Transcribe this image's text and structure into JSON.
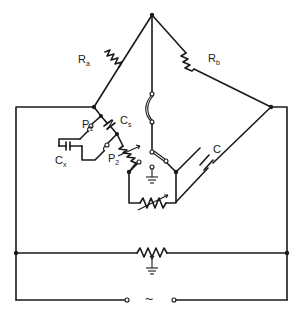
{
  "diagram": {
    "type": "circuit-schematic",
    "labels": {
      "ra": {
        "main": "R",
        "sub": "a"
      },
      "rb": {
        "main": "R",
        "sub": "b"
      },
      "cs": {
        "main": "C",
        "sub": "s"
      },
      "cx": {
        "main": "C",
        "sub": "x"
      },
      "p1": {
        "main": "P",
        "sub": "1"
      },
      "p2": {
        "main": "P",
        "sub": "2"
      },
      "c": {
        "main": "C",
        "sub": ""
      },
      "source": "~"
    },
    "components": [
      "resistor Ra (top-left arm)",
      "resistor Rb (top-right arm)",
      "variable capacitor Cs",
      "capacitor Cx (unknown)",
      "terminal pair P1",
      "terminal pair P2",
      "variable resistor (lower-left arm)",
      "capacitor C (lower-right arm)",
      "variable resistor (bottom of bridge)",
      "detector switch",
      "ground symbol (bridge)",
      "potentiometer with ground tap (Wagner earth)",
      "AC source"
    ],
    "colors": {
      "stroke": "#1a1a1a",
      "background": "#ffffff"
    }
  }
}
